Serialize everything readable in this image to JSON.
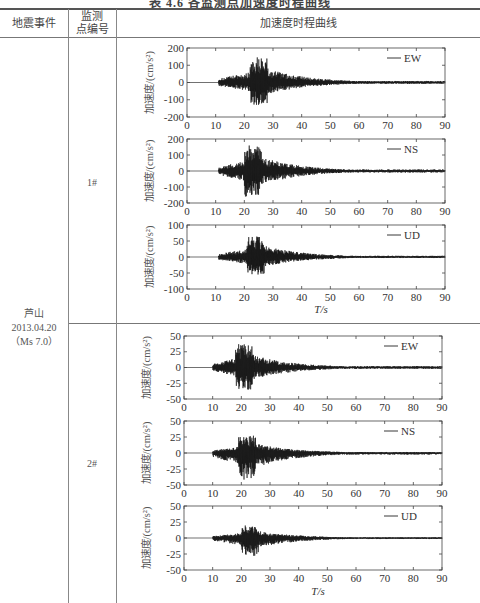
{
  "title": "表 4.6  各监测点加速度时程曲线",
  "table": {
    "headers": [
      "地震事件",
      "监测\n点编号",
      "加速度时程曲线"
    ],
    "header_col1": "地震事件",
    "header_col2_line1": "监测",
    "header_col2_line2": "点编号",
    "header_col3": "加速度时程曲线",
    "event": {
      "name": "芦山",
      "date": "2013.04.20",
      "magnitude": "（Ms 7.0）"
    },
    "stations": [
      {
        "id": "1#"
      },
      {
        "id": "2#"
      }
    ]
  },
  "chart_data": [
    {
      "type": "line",
      "station": "1#",
      "component": "EW",
      "legend": "EW",
      "ylabel": "加速度/(cm/s²)",
      "xlabel": "",
      "xlim": [
        0,
        90
      ],
      "ylim": [
        -200,
        200
      ],
      "xticks": [
        0,
        10,
        20,
        30,
        40,
        50,
        60,
        70,
        80,
        90
      ],
      "yticks": [
        -200,
        -100,
        0,
        100,
        200
      ],
      "envelope": {
        "onset_s": 11,
        "peak_time_s": 25,
        "peak_pos": 150,
        "peak_neg": -130
      }
    },
    {
      "type": "line",
      "station": "1#",
      "component": "NS",
      "legend": "NS",
      "ylabel": "加速度/(cm/s²)",
      "xlabel": "",
      "xlim": [
        0,
        90
      ],
      "ylim": [
        -200,
        200
      ],
      "xticks": [
        0,
        10,
        20,
        30,
        40,
        50,
        60,
        70,
        80,
        90
      ],
      "yticks": [
        -200,
        -100,
        0,
        100,
        200
      ],
      "envelope": {
        "onset_s": 11,
        "peak_time_s": 23,
        "peak_pos": 160,
        "peak_neg": -160
      }
    },
    {
      "type": "line",
      "station": "1#",
      "component": "UD",
      "legend": "UD",
      "ylabel": "加速度/(cm/s²)",
      "xlabel": "T/s",
      "xlim": [
        0,
        90
      ],
      "ylim": [
        -100,
        100
      ],
      "xticks": [
        0,
        10,
        20,
        30,
        40,
        50,
        60,
        70,
        80,
        90
      ],
      "yticks": [
        -100,
        -50,
        0,
        50,
        100
      ],
      "envelope": {
        "onset_s": 11,
        "peak_time_s": 24,
        "peak_pos": 65,
        "peak_neg": -55
      }
    },
    {
      "type": "line",
      "station": "2#",
      "component": "EW",
      "legend": "EW",
      "ylabel": "加速度/(cm/s²)",
      "xlabel": "",
      "xlim": [
        0,
        90
      ],
      "ylim": [
        -50,
        50
      ],
      "xticks": [
        0,
        10,
        20,
        30,
        40,
        50,
        60,
        70,
        80,
        90
      ],
      "yticks": [
        -50,
        -25,
        0,
        25,
        50
      ],
      "envelope": {
        "onset_s": 10,
        "peak_time_s": 21,
        "peak_pos": 37,
        "peak_neg": -35
      }
    },
    {
      "type": "line",
      "station": "2#",
      "component": "NS",
      "legend": "NS",
      "ylabel": "加速度/(cm/s²)",
      "xlabel": "",
      "xlim": [
        0,
        90
      ],
      "ylim": [
        -50,
        50
      ],
      "xticks": [
        0,
        10,
        20,
        30,
        40,
        50,
        60,
        70,
        80,
        90
      ],
      "yticks": [
        -50,
        -25,
        0,
        25,
        50
      ],
      "envelope": {
        "onset_s": 10,
        "peak_time_s": 22,
        "peak_pos": 27,
        "peak_neg": -42
      }
    },
    {
      "type": "line",
      "station": "2#",
      "component": "UD",
      "legend": "UD",
      "ylabel": "加速度/(cm/s²)",
      "xlabel": "T/s",
      "xlim": [
        0,
        90
      ],
      "ylim": [
        -50,
        50
      ],
      "xticks": [
        0,
        10,
        20,
        30,
        40,
        50,
        60,
        70,
        80,
        90
      ],
      "yticks": [
        -50,
        -25,
        0,
        25,
        50
      ],
      "envelope": {
        "onset_s": 10,
        "peak_time_s": 23,
        "peak_pos": 20,
        "peak_neg": -28
      }
    }
  ]
}
